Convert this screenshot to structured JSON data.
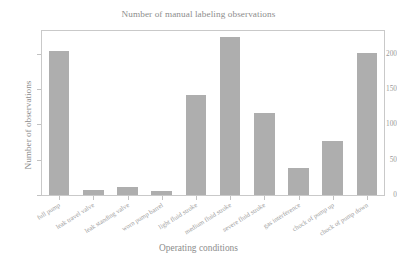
{
  "chart_data": {
    "type": "bar",
    "title": "Number of manual labeling observations",
    "xlabel": "Operating conditions",
    "ylabel": "Number of observations",
    "categories": [
      "full pump",
      "leak travel valve",
      "leak standing valve",
      "worn pump barrel",
      "light fluid stroke",
      "medium fluid stroke",
      "severe fluid stroke",
      "gas interference",
      "chock of pump up",
      "chock of pump down"
    ],
    "values": [
      204,
      7,
      12,
      6,
      142,
      224,
      116,
      38,
      76,
      201
    ],
    "ylim": [
      0,
      232
    ],
    "xlim_padding": 0.5,
    "yticks": [
      0,
      50,
      100,
      150,
      200
    ],
    "ytick_labels": [
      "0",
      "50",
      "100",
      "150",
      "200"
    ],
    "grid": false,
    "legend": null,
    "bar_color": "#aeaeae",
    "frame_color": "#c9c9c9",
    "text_color": "#8d8d8d"
  }
}
